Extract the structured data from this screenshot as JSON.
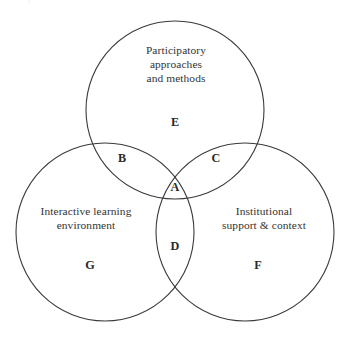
{
  "figure": {
    "type": "venn-diagram-3-set",
    "background_color": "#ffffff",
    "stroke_color": "#3a3a3a",
    "text_color": "#333333",
    "clipped_header_text": "f",
    "sets": [
      {
        "id": "top",
        "label": "Participatory\napproaches\nand methods",
        "exclusive_region_letter": "E"
      },
      {
        "id": "left",
        "label": "Interactive learning\nenvironment",
        "exclusive_region_letter": "G"
      },
      {
        "id": "right",
        "label": "Institutional\nsupport & context",
        "exclusive_region_letter": "F"
      }
    ],
    "regions": [
      {
        "letter": "A",
        "description": "top and left and right"
      },
      {
        "letter": "B",
        "description": "top and left"
      },
      {
        "letter": "C",
        "description": "top and right"
      },
      {
        "letter": "D",
        "description": "left and right"
      },
      {
        "letter": "E",
        "description": "top only"
      },
      {
        "letter": "F",
        "description": "right only"
      },
      {
        "letter": "G",
        "description": "left only"
      }
    ],
    "geometry": {
      "radius": 89,
      "circles": [
        {
          "id": "top",
          "cx": 175,
          "cy": 110
        },
        {
          "id": "left",
          "cx": 105,
          "cy": 232
        },
        {
          "id": "right",
          "cx": 245,
          "cy": 232
        }
      ]
    }
  }
}
